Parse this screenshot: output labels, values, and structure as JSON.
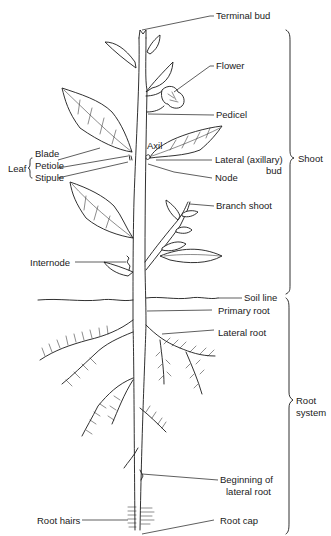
{
  "diagram": {
    "title": "",
    "labels": {
      "terminal_bud": "Terminal bud",
      "flower": "Flower",
      "pedicel": "Pedicel",
      "leaf": "Leaf",
      "blade": "Blade",
      "petiole": "Petiole",
      "stipule": "Stipule",
      "axil": "Axil",
      "lateral_bud_line1": "Lateral (axillary)",
      "lateral_bud_line2": "bud",
      "node": "Node",
      "branch_shoot": "Branch shoot",
      "internode": "Internode",
      "soil_line": "Soil line",
      "primary_root": "Primary root",
      "lateral_root": "Lateral root",
      "beginning_line1": "Beginning of",
      "beginning_line2": "lateral root",
      "root_hairs": "Root hairs",
      "root_cap": "Root cap"
    },
    "groups": {
      "shoot": "Shoot",
      "root_system_line1": "Root",
      "root_system_line2": "system"
    }
  }
}
